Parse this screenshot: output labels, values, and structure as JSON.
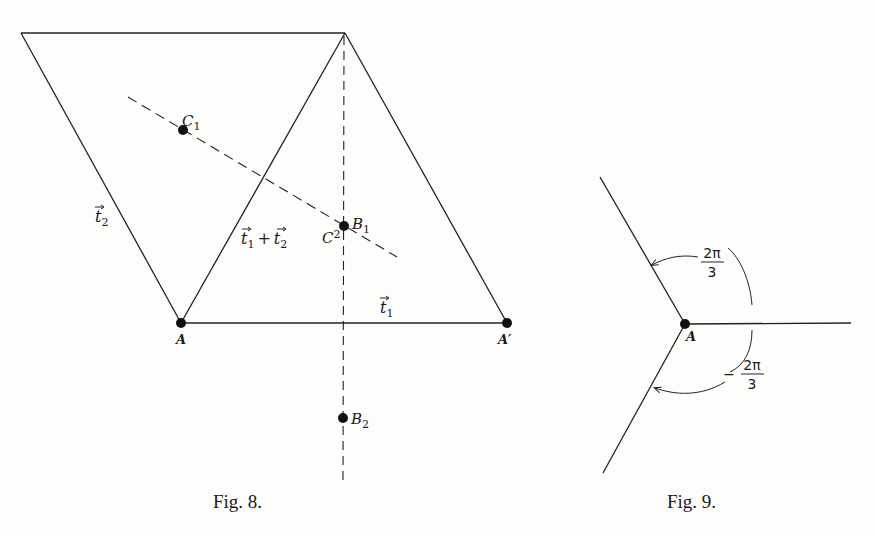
{
  "figures": [
    {
      "id": "fig8",
      "caption": "Fig. 8.",
      "caption_small": "IG",
      "points": {
        "A": {
          "label": "A",
          "x": 181,
          "y": 323
        },
        "A_prime": {
          "label": "A′",
          "x": 507,
          "y": 323
        },
        "C1": {
          "label": "C",
          "sub": "1",
          "x": 183,
          "y": 130
        },
        "B1": {
          "label": "B",
          "sub": "1",
          "x": 344,
          "y": 226
        },
        "C2": {
          "label": "C",
          "sub": "2",
          "x": 344,
          "y": 226
        },
        "B2": {
          "label": "B",
          "sub": "2",
          "x": 343,
          "y": 418
        }
      },
      "vector_labels": {
        "t1": {
          "base": "t",
          "sub": "1"
        },
        "t2": {
          "base": "t",
          "sub": "2"
        },
        "sum": {
          "a": "t",
          "a_sub": "1",
          "op": "+",
          "b": "t",
          "b_sub": "2"
        }
      }
    },
    {
      "id": "fig9",
      "caption": "Fig. 9.",
      "point": {
        "label": "A",
        "x": 685,
        "y": 324
      },
      "angles": [
        {
          "sign": "",
          "num": "2π",
          "den": "3"
        },
        {
          "sign": "−",
          "num": "2π",
          "den": "3"
        }
      ]
    }
  ]
}
